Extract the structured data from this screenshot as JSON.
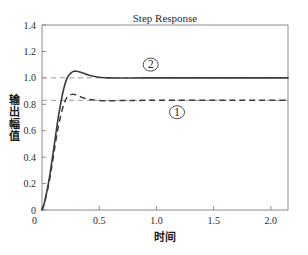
{
  "chart_data": {
    "type": "line",
    "title": "Step Response",
    "xlabel": "时间",
    "ylabel": "输出幅值",
    "xlim": [
      0,
      2.15
    ],
    "ylim": [
      0,
      1.4
    ],
    "grid": false,
    "legend_position": "inline-annotations",
    "xticks": [
      "0",
      "0.5",
      "1.0",
      "1.5",
      "2.0"
    ],
    "xtick_values": [
      0,
      0.5,
      1.0,
      1.5,
      2.0
    ],
    "yticks": [
      "0",
      "0.2",
      "0.4",
      "0.6",
      "0.8",
      "1.0",
      "1.2",
      "1.4"
    ],
    "ytick_values": [
      0,
      0.2,
      0.4,
      0.6,
      0.8,
      1.0,
      1.2,
      1.4
    ],
    "annotations": [
      {
        "label": "①",
        "x": 1.18,
        "y": 0.74,
        "describes": "curve-1-dashed"
      },
      {
        "label": "②",
        "x": 0.95,
        "y": 1.1,
        "describes": "curve-2-solid"
      }
    ],
    "reference_lines": [
      {
        "value": 1.0,
        "style": "dashed",
        "label": "steady-state-2"
      },
      {
        "value": 0.83,
        "style": "dashed",
        "label": "steady-state-1"
      }
    ],
    "series": [
      {
        "name": "①",
        "style": "dashed",
        "steady_state": 0.83,
        "overshoot_peak": 0.875,
        "peak_time": 0.28,
        "x": [
          0,
          0.02,
          0.04,
          0.06,
          0.08,
          0.1,
          0.12,
          0.14,
          0.16,
          0.18,
          0.2,
          0.22,
          0.24,
          0.26,
          0.28,
          0.3,
          0.32,
          0.35,
          0.38,
          0.42,
          0.46,
          0.5,
          0.55,
          0.6,
          0.7,
          0.8,
          1.0,
          1.3,
          1.7,
          2.15
        ],
        "y": [
          0,
          0.05,
          0.12,
          0.2,
          0.3,
          0.41,
          0.52,
          0.62,
          0.7,
          0.77,
          0.82,
          0.855,
          0.87,
          0.875,
          0.875,
          0.87,
          0.862,
          0.852,
          0.843,
          0.836,
          0.832,
          0.829,
          0.827,
          0.827,
          0.828,
          0.829,
          0.83,
          0.83,
          0.83,
          0.83
        ]
      },
      {
        "name": "②",
        "style": "solid",
        "steady_state": 1.0,
        "overshoot_peak": 1.05,
        "peak_time": 0.3,
        "x": [
          0,
          0.02,
          0.04,
          0.06,
          0.08,
          0.1,
          0.12,
          0.14,
          0.16,
          0.18,
          0.2,
          0.22,
          0.24,
          0.26,
          0.28,
          0.3,
          0.33,
          0.36,
          0.4,
          0.44,
          0.48,
          0.52,
          0.58,
          0.65,
          0.75,
          0.9,
          1.2,
          1.6,
          2.15
        ],
        "y": [
          0,
          0.05,
          0.13,
          0.22,
          0.33,
          0.45,
          0.57,
          0.69,
          0.79,
          0.88,
          0.95,
          1.0,
          1.025,
          1.042,
          1.05,
          1.05,
          1.045,
          1.036,
          1.024,
          1.014,
          1.007,
          1.003,
          1.0,
          0.999,
          0.999,
          1.0,
          1.0,
          1.0,
          1.0
        ]
      }
    ]
  }
}
